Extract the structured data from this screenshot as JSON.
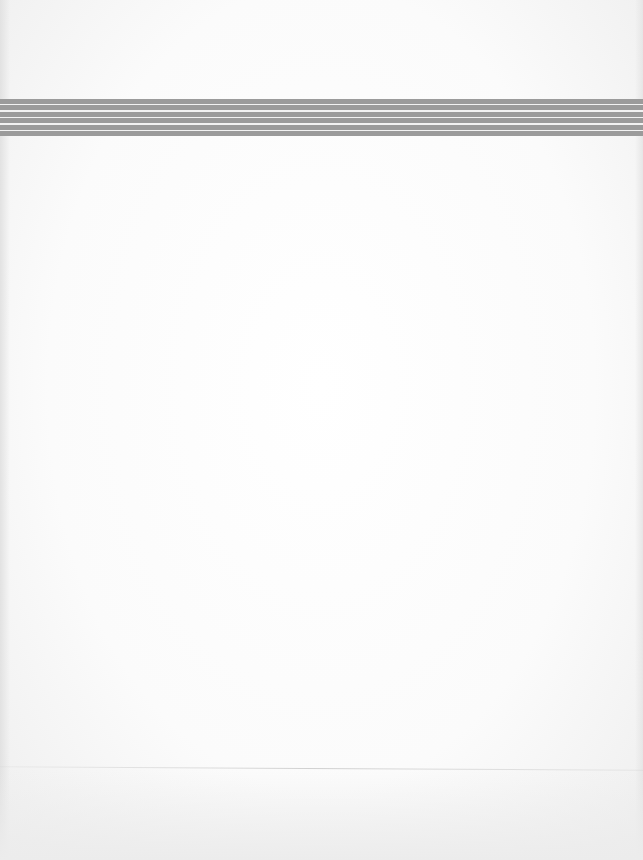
{
  "page": {
    "type": "blank scanned page",
    "text": ""
  },
  "band": {
    "stripe_count": 6,
    "stripe_color": "#9b9b9b",
    "separator_color": "#f2f2f2"
  },
  "colors": {
    "paper": "#fbfbfb"
  }
}
